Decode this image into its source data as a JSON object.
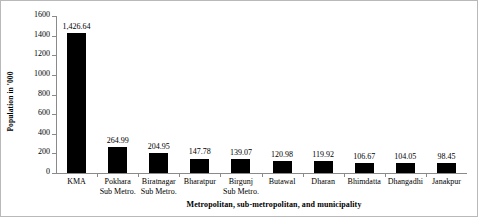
{
  "chart_data": {
    "type": "bar",
    "title": "",
    "xlabel": "Metropolitan, sub-metropolitan, and municipality",
    "ylabel": "Population in '000",
    "ylim": [
      0,
      1600
    ],
    "yticks": [
      "0",
      "200",
      "400",
      "600",
      "800",
      "1000",
      "1200",
      "1400",
      "1600"
    ],
    "grid": false,
    "legend": "none",
    "bar_color": "#000000",
    "axis_color": "#8a8a8a",
    "categories": [
      "KMA",
      "Pokhara Sub Metro.",
      "Biratnagar Sub Metro.",
      "Bharatpur",
      "Birgunj Sub Metro.",
      "Butawal",
      "Dharan",
      "Bhimdatta",
      "Dhangadhi",
      "Janakpur"
    ],
    "category_lines": [
      {
        "line1": "KMA",
        "line2": ""
      },
      {
        "line1": "Pokhara",
        "line2": "Sub Metro."
      },
      {
        "line1": "Biratnagar",
        "line2": "Sub Metro."
      },
      {
        "line1": "Bharatpur",
        "line2": ""
      },
      {
        "line1": "Birgunj",
        "line2": "Sub Metro."
      },
      {
        "line1": "Butawal",
        "line2": ""
      },
      {
        "line1": "Dharan",
        "line2": ""
      },
      {
        "line1": "Bhimdatta",
        "line2": ""
      },
      {
        "line1": "Dhangadhi",
        "line2": ""
      },
      {
        "line1": "Janakpur",
        "line2": ""
      }
    ],
    "values": [
      1426.64,
      264.99,
      204.95,
      147.78,
      139.07,
      120.98,
      119.92,
      106.67,
      104.05,
      98.45
    ],
    "value_labels": [
      "1,426.64",
      "264.99",
      "204.95",
      "147.78",
      "139.07",
      "120.98",
      "119.92",
      "106.67",
      "104.05",
      "98.45"
    ]
  }
}
